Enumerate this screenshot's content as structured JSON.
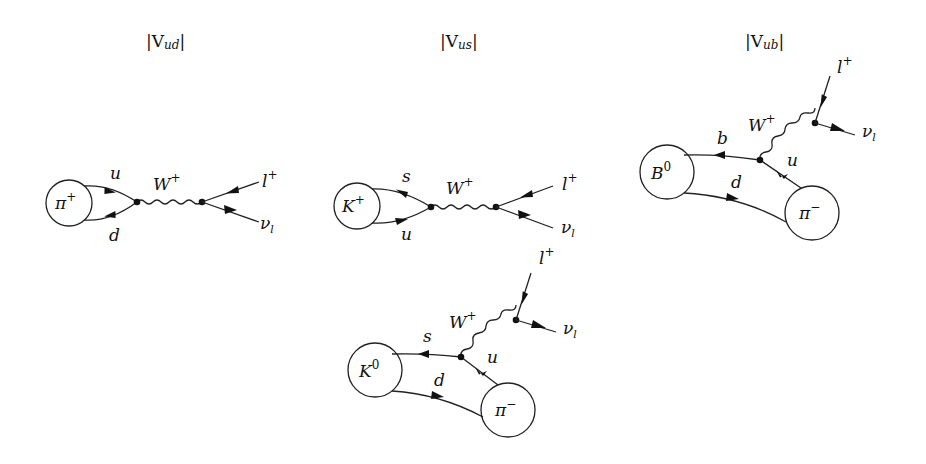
{
  "diagrams": [
    {
      "id": "vud",
      "title": "|Vud|",
      "title_parts": {
        "pre": "|V",
        "sub": "ud",
        "post": "|"
      },
      "meson": {
        "label": "π",
        "sup": "+"
      },
      "quarks": {
        "top": "u",
        "bottom": "d"
      },
      "boson": {
        "label": "W",
        "sup": "+"
      },
      "leptons": {
        "lepton": "l",
        "lepton_sup": "+",
        "neutrino": "ν",
        "neutrino_sub": "l"
      }
    },
    {
      "id": "vus",
      "title": "|Vus|",
      "title_parts": {
        "pre": "|V",
        "sub": "us",
        "post": "|"
      },
      "meson": {
        "label": "K",
        "sup": "+"
      },
      "quarks": {
        "top": "s",
        "bottom": "u"
      },
      "boson": {
        "label": "W",
        "sup": "+"
      },
      "leptons": {
        "lepton": "l",
        "lepton_sup": "+",
        "neutrino": "ν",
        "neutrino_sub": "l"
      }
    },
    {
      "id": "vub",
      "title": "|Vub|",
      "title_parts": {
        "pre": "|V",
        "sub": "ub",
        "post": "|"
      },
      "initial_meson": {
        "label": "B",
        "sup": "0"
      },
      "final_meson": {
        "label": "π",
        "sup": "−"
      },
      "quarks": {
        "outgoing": "b",
        "spectator": "d",
        "produced": "u"
      },
      "boson": {
        "label": "W",
        "sup": "+"
      },
      "leptons": {
        "lepton": "l",
        "lepton_sup": "+",
        "neutrino": "ν",
        "neutrino_sub": "l"
      }
    },
    {
      "id": "vus-semileptonic",
      "initial_meson": {
        "label": "K",
        "sup": "0"
      },
      "final_meson": {
        "label": "π",
        "sup": "−"
      },
      "quarks": {
        "outgoing": "s",
        "spectator": "d",
        "produced": "u"
      },
      "boson": {
        "label": "W",
        "sup": "+"
      },
      "leptons": {
        "lepton": "l",
        "lepton_sup": "+",
        "neutrino": "ν",
        "neutrino_sub": "l"
      }
    }
  ],
  "colors": {
    "ink": "#222222",
    "background": "#ffffff"
  }
}
